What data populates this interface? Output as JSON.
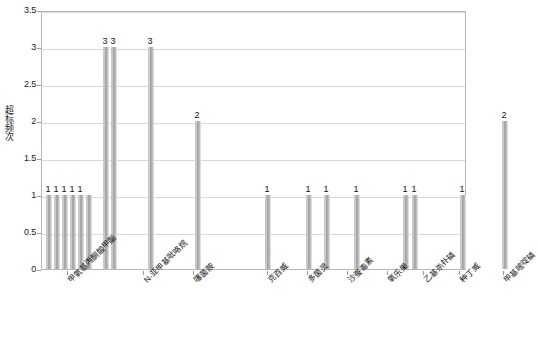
{
  "chart_data": {
    "type": "bar",
    "title": "",
    "subtitle": "",
    "xlabel": "",
    "ylabel": "超标频次",
    "ylim": [
      0,
      3.5
    ],
    "ytick_labels": [
      "0",
      "0.5",
      "1",
      "1.5",
      "2",
      "2.5",
      "3",
      "3.5"
    ],
    "ytick_values": [
      0,
      0.5,
      1,
      1.5,
      2,
      2.5,
      3,
      3.5
    ],
    "grid": true,
    "legend": "none",
    "categories": [
      "甲氧基丙酮酸甲酯",
      "N-亚甲基吡咯烷",
      "噻菌胺",
      "克百威",
      "多菌灵",
      "沙蚕毒素",
      "氧乐果",
      "乙基杀扑磷",
      "种丁威",
      "甲基嘧啶磷"
    ],
    "bars": [
      {
        "value": 1,
        "label": "1"
      },
      {
        "value": 1,
        "label": "1"
      },
      {
        "value": 1,
        "label": "1"
      },
      {
        "value": 1,
        "label": "1"
      },
      {
        "value": 1,
        "label": "1"
      },
      {
        "value": 1,
        "label": ""
      },
      {
        "value": 3,
        "label": "3"
      },
      {
        "value": 3,
        "label": "3"
      },
      {
        "value": 3,
        "label": "3"
      },
      {
        "value": 2,
        "label": "2"
      },
      {
        "value": 1,
        "label": "1"
      },
      {
        "value": 1,
        "label": "1"
      },
      {
        "value": 1,
        "label": "1"
      },
      {
        "value": 1,
        "label": "1"
      },
      {
        "value": 1,
        "label": "1"
      },
      {
        "value": 1,
        "label": "1"
      },
      {
        "value": 1,
        "label": "1"
      },
      {
        "value": 2,
        "label": "2"
      }
    ],
    "bar_color": "#a8a8a8",
    "grid_color": "#d9d9d9",
    "axis_color": "#b8b8b8"
  }
}
